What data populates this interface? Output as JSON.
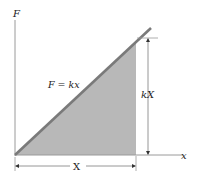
{
  "diagram": {
    "labels": {
      "y_axis": "F",
      "x_axis": "x",
      "line_equation": "F = kx",
      "height_dimension": "kX",
      "width_dimension": "X"
    },
    "colors": {
      "shaded_area": "#b8b8b8",
      "line": "#7a7a7a",
      "axes": "#9a9a9a",
      "text": "#222222"
    },
    "geometry": {
      "origin": [
        15,
        155
      ],
      "line_end": [
        151,
        28
      ],
      "shade_right_x": 136,
      "dim_kX_x": 148,
      "dim_X_y": 166
    }
  }
}
